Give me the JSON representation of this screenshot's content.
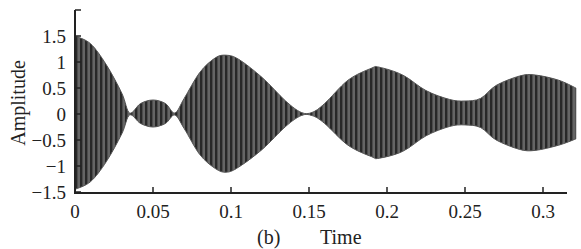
{
  "chart_data": {
    "type": "line",
    "title": "",
    "panel_label": "(b)",
    "xlabel": "Time",
    "ylabel": "Amplitude",
    "xlim": [
      0,
      0.316
    ],
    "ylim": [
      -1.5,
      1.9
    ],
    "x_ticks": [
      0,
      0.05,
      0.1,
      0.15,
      0.2,
      0.25,
      0.3
    ],
    "x_tick_labels": [
      "0",
      "0.05",
      "0.1",
      "0.15",
      "0.2",
      "0.25",
      "0.3"
    ],
    "y_ticks": [
      -1.5,
      -1,
      -0.5,
      0,
      0.5,
      1,
      1.5
    ],
    "y_tick_labels": [
      "−1.5",
      "−1",
      "−0.5",
      "0",
      "0.5",
      "1",
      "1.5"
    ],
    "grid": false,
    "legend": null,
    "series": [
      {
        "name": "signal envelope (upper)",
        "x": [
          0,
          0.01,
          0.02,
          0.03,
          0.035,
          0.042,
          0.05,
          0.058,
          0.064,
          0.07,
          0.08,
          0.09,
          0.097,
          0.105,
          0.12,
          0.135,
          0.145,
          0.152,
          0.16,
          0.175,
          0.19,
          0.195,
          0.21,
          0.225,
          0.24,
          0.25,
          0.26,
          0.27,
          0.285,
          0.295,
          0.31,
          0.321
        ],
        "values": [
          1.5,
          1.35,
          0.95,
          0.4,
          0.02,
          0.2,
          0.27,
          0.2,
          0.02,
          0.3,
          0.8,
          1.08,
          1.13,
          1.05,
          0.7,
          0.25,
          0.03,
          0.03,
          0.2,
          0.65,
          0.88,
          0.9,
          0.75,
          0.45,
          0.28,
          0.25,
          0.3,
          0.55,
          0.73,
          0.75,
          0.65,
          0.5
        ]
      },
      {
        "name": "signal envelope (lower)",
        "x": [
          0,
          0.01,
          0.02,
          0.03,
          0.035,
          0.042,
          0.05,
          0.058,
          0.064,
          0.07,
          0.08,
          0.09,
          0.097,
          0.105,
          0.12,
          0.135,
          0.145,
          0.152,
          0.16,
          0.175,
          0.19,
          0.195,
          0.21,
          0.225,
          0.24,
          0.25,
          0.26,
          0.27,
          0.285,
          0.295,
          0.31,
          0.321
        ],
        "values": [
          -1.45,
          -1.3,
          -0.92,
          -0.38,
          -0.02,
          -0.18,
          -0.25,
          -0.18,
          -0.02,
          -0.28,
          -0.78,
          -1.05,
          -1.12,
          -1.02,
          -0.68,
          -0.24,
          -0.03,
          -0.03,
          -0.18,
          -0.6,
          -0.82,
          -0.85,
          -0.72,
          -0.42,
          -0.24,
          -0.21,
          -0.26,
          -0.5,
          -0.68,
          -0.7,
          -0.6,
          -0.48
        ]
      }
    ],
    "colors": {
      "dark_stripe": "#2e2e2e",
      "light_stripe": "#8c8c8c",
      "axis": "#222222"
    }
  }
}
